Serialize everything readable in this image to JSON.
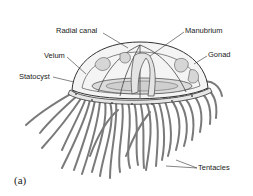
{
  "figure": {
    "panel_label": "(a)",
    "labels": {
      "radial_canal": "Radial canal",
      "manubrium": "Manubrium",
      "velum": "Velum",
      "gonad": "Gonad",
      "statocyst": "Statocyst",
      "tentacles": "Tentacles"
    },
    "colors": {
      "outline": "#333333",
      "fill_light": "#f2f2f2",
      "fill_mid": "#d9d9d9",
      "tentacle": "#7a7a7a",
      "text": "#222222"
    }
  }
}
